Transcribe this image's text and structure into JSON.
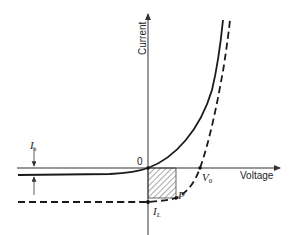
{
  "diagram": {
    "axes": {
      "x_label": "Voltage",
      "y_label": "Current",
      "origin_label": "0"
    },
    "labels": {
      "saturation_current": "I",
      "saturation_current_sub": "s",
      "open_circuit_voltage": "V",
      "open_circuit_voltage_sub": "0",
      "light_current": "I",
      "light_current_sub": "L",
      "operating_point": "P"
    },
    "curves": [
      {
        "name": "dark-curve",
        "style": "solid"
      },
      {
        "name": "illuminated-curve",
        "style": "dashed"
      }
    ],
    "shaded_region": "max-power-rectangle",
    "colors": {
      "line": "#1a1a1a",
      "axis": "#333333",
      "hatch": "#555555"
    }
  }
}
